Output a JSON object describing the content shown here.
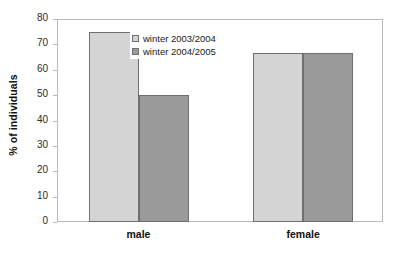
{
  "chart_data": {
    "type": "bar",
    "title": "",
    "subtitle": "",
    "xlabel": "",
    "ylabel": "% of individuals",
    "categories": [
      "male",
      "female"
    ],
    "series": [
      {
        "name": "winter 2003/2004",
        "color": "#d4d4d4",
        "values": [
          75,
          66.7
        ]
      },
      {
        "name": "winter 2004/2005",
        "color": "#9a9a9a",
        "values": [
          50,
          66.7
        ]
      }
    ],
    "ylim": [
      0,
      80
    ],
    "ytick_step": 10,
    "yticks": [
      0,
      10,
      20,
      30,
      40,
      50,
      60,
      70,
      80
    ],
    "ytick_labels": [
      "0",
      "10",
      "20",
      "30",
      "40",
      "50",
      "60",
      "70",
      "80"
    ],
    "grid": false,
    "legend_position": "inside-top-left",
    "bar_border_color": "#6f6f6f",
    "axis_color": "#b9b9b9"
  }
}
